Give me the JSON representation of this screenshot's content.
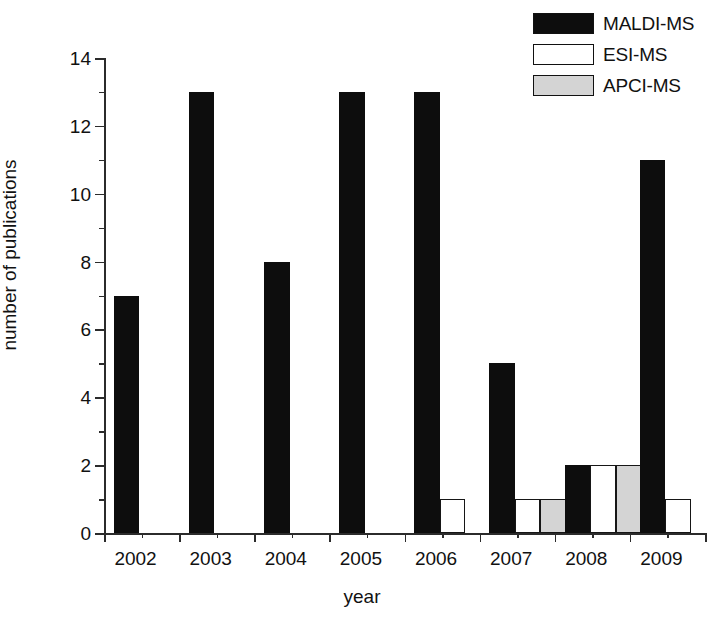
{
  "chart_data": {
    "type": "bar",
    "title": "",
    "subtitle": "",
    "xlabel": "year",
    "ylabel": "number of publications",
    "categories": [
      "2002",
      "2003",
      "2004",
      "2005",
      "2006",
      "2007",
      "2008",
      "2009"
    ],
    "series": [
      {
        "name": "MALDI-MS",
        "color": "#0d0d0d",
        "key": "maldi",
        "values": [
          7,
          13,
          8,
          13,
          13,
          5,
          2,
          11
        ]
      },
      {
        "name": "ESI-MS",
        "color": "#ffffff",
        "key": "esi",
        "values": [
          0,
          0,
          0,
          0,
          1,
          1,
          2,
          1
        ]
      },
      {
        "name": "APCI-MS",
        "color": "#d4d4d4",
        "key": "apci",
        "values": [
          0,
          0,
          0,
          0,
          0,
          1,
          2,
          0
        ]
      }
    ],
    "ylim": [
      0,
      14
    ],
    "ytick_major": [
      0,
      2,
      4,
      6,
      8,
      10,
      12,
      14
    ],
    "ytick_minor": [
      1,
      3,
      5,
      7,
      9,
      11,
      13
    ],
    "grid": false,
    "legend_position": "top-right"
  },
  "legend": {
    "entries": [
      {
        "label": "MALDI-MS",
        "swatch": "black-swatch"
      },
      {
        "label": "ESI-MS",
        "swatch": "white-swatch"
      },
      {
        "label": "APCI-MS",
        "swatch": "gray-swatch"
      }
    ]
  },
  "axes": {
    "x_title": "year",
    "y_title": "number of publications",
    "y_tick_labels": [
      "0",
      "2",
      "4",
      "6",
      "8",
      "10",
      "12",
      "14"
    ],
    "x_tick_labels": [
      "2002",
      "2003",
      "2004",
      "2005",
      "2006",
      "2007",
      "2008",
      "2009"
    ]
  },
  "colors": {
    "maldi": "#0d0d0d",
    "esi": "#ffffff",
    "apci": "#d4d4d4",
    "axis": "#2b2b2b",
    "text": "#111111",
    "background": "#ffffff"
  }
}
